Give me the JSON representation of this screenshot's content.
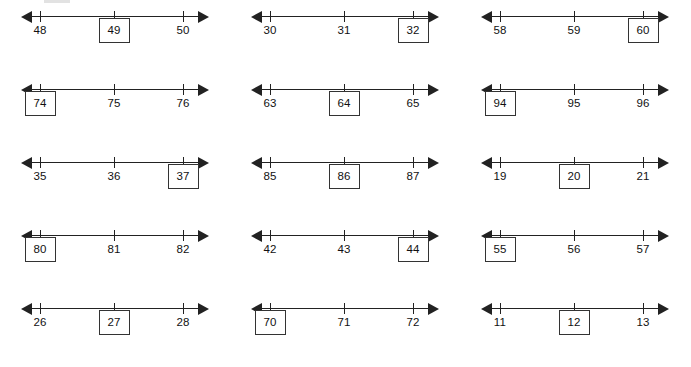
{
  "worksheet": {
    "type": "number-line-fill-in",
    "columns": 3,
    "rows": 5,
    "tick_count_per_line": 3,
    "line_style": "double-headed-arrow",
    "colors": {
      "ink": "#222222",
      "text": "#111111",
      "box_border": "#333333",
      "background": "#ffffff"
    },
    "problems": [
      {
        "id": "problem-1",
        "row": 1,
        "column": 1,
        "boxed_index": 1,
        "ticks": [
          {
            "value": "48",
            "boxed": false
          },
          {
            "value": "49",
            "boxed": true
          },
          {
            "value": "50",
            "boxed": false
          }
        ]
      },
      {
        "id": "problem-2",
        "row": 1,
        "column": 2,
        "boxed_index": 2,
        "ticks": [
          {
            "value": "30",
            "boxed": false
          },
          {
            "value": "31",
            "boxed": false
          },
          {
            "value": "32",
            "boxed": true
          }
        ]
      },
      {
        "id": "problem-3",
        "row": 1,
        "column": 3,
        "boxed_index": 2,
        "ticks": [
          {
            "value": "58",
            "boxed": false
          },
          {
            "value": "59",
            "boxed": false
          },
          {
            "value": "60",
            "boxed": true
          }
        ]
      },
      {
        "id": "problem-4",
        "row": 2,
        "column": 1,
        "boxed_index": 0,
        "ticks": [
          {
            "value": "74",
            "boxed": true
          },
          {
            "value": "75",
            "boxed": false
          },
          {
            "value": "76",
            "boxed": false
          }
        ]
      },
      {
        "id": "problem-5",
        "row": 2,
        "column": 2,
        "boxed_index": 1,
        "ticks": [
          {
            "value": "63",
            "boxed": false
          },
          {
            "value": "64",
            "boxed": true
          },
          {
            "value": "65",
            "boxed": false
          }
        ]
      },
      {
        "id": "problem-6",
        "row": 2,
        "column": 3,
        "boxed_index": 0,
        "ticks": [
          {
            "value": "94",
            "boxed": true
          },
          {
            "value": "95",
            "boxed": false
          },
          {
            "value": "96",
            "boxed": false
          }
        ]
      },
      {
        "id": "problem-7",
        "row": 3,
        "column": 1,
        "boxed_index": 2,
        "ticks": [
          {
            "value": "35",
            "boxed": false
          },
          {
            "value": "36",
            "boxed": false
          },
          {
            "value": "37",
            "boxed": true
          }
        ]
      },
      {
        "id": "problem-8",
        "row": 3,
        "column": 2,
        "boxed_index": 1,
        "ticks": [
          {
            "value": "85",
            "boxed": false
          },
          {
            "value": "86",
            "boxed": true
          },
          {
            "value": "87",
            "boxed": false
          }
        ]
      },
      {
        "id": "problem-9",
        "row": 3,
        "column": 3,
        "boxed_index": 1,
        "ticks": [
          {
            "value": "19",
            "boxed": false
          },
          {
            "value": "20",
            "boxed": true
          },
          {
            "value": "21",
            "boxed": false
          }
        ]
      },
      {
        "id": "problem-10",
        "row": 4,
        "column": 1,
        "boxed_index": 0,
        "ticks": [
          {
            "value": "80",
            "boxed": true
          },
          {
            "value": "81",
            "boxed": false
          },
          {
            "value": "82",
            "boxed": false
          }
        ]
      },
      {
        "id": "problem-11",
        "row": 4,
        "column": 2,
        "boxed_index": 2,
        "ticks": [
          {
            "value": "42",
            "boxed": false
          },
          {
            "value": "43",
            "boxed": false
          },
          {
            "value": "44",
            "boxed": true
          }
        ]
      },
      {
        "id": "problem-12",
        "row": 4,
        "column": 3,
        "boxed_index": 0,
        "ticks": [
          {
            "value": "55",
            "boxed": true
          },
          {
            "value": "56",
            "boxed": false
          },
          {
            "value": "57",
            "boxed": false
          }
        ]
      },
      {
        "id": "problem-13",
        "row": 5,
        "column": 1,
        "boxed_index": 1,
        "ticks": [
          {
            "value": "26",
            "boxed": false
          },
          {
            "value": "27",
            "boxed": true
          },
          {
            "value": "28",
            "boxed": false
          }
        ]
      },
      {
        "id": "problem-14",
        "row": 5,
        "column": 2,
        "boxed_index": 0,
        "ticks": [
          {
            "value": "70",
            "boxed": true
          },
          {
            "value": "71",
            "boxed": false
          },
          {
            "value": "72",
            "boxed": false
          }
        ]
      },
      {
        "id": "problem-15",
        "row": 5,
        "column": 3,
        "boxed_index": 1,
        "ticks": [
          {
            "value": "11",
            "boxed": false
          },
          {
            "value": "12",
            "boxed": true
          },
          {
            "value": "13",
            "boxed": false
          }
        ]
      }
    ]
  }
}
